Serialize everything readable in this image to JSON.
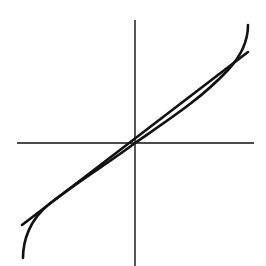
{
  "figure": {
    "colors": {
      "background": "#ffffff",
      "ink": "#111111"
    }
  },
  "axes": {
    "origin_px": [
      135,
      143
    ],
    "horizontal": {
      "x1": 17,
      "x2": 254,
      "y": 143
    },
    "vertical": {
      "x": 135,
      "y1": 20,
      "y2": 266
    }
  },
  "curves": {
    "line": {
      "name": "linear approximation",
      "path": "M 22 225 L 248 52"
    },
    "s_curve": {
      "name": "nonlinear curve",
      "path": "M 23 258 C 23 240, 30 220, 48 205 C 80 180, 110 162, 135 143 C 165 122, 200 100, 228 70 C 242 55, 248 40, 248 25"
    }
  }
}
